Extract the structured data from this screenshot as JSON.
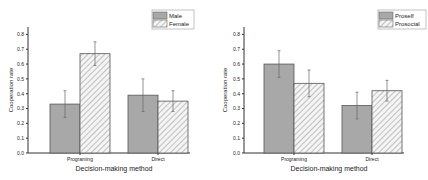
{
  "chart_data": [
    {
      "type": "bar",
      "title": "",
      "xlabel": "Decision-making method",
      "ylabel": "Cooperation rate",
      "ylim": [
        0,
        0.85
      ],
      "yticks": [
        "0.0",
        "0.1",
        "0.2",
        "0.3",
        "0.4",
        "0.5",
        "0.6",
        "0.7",
        "0.8"
      ],
      "categories": [
        "Programing",
        "Direct"
      ],
      "series": [
        {
          "name": "Male",
          "values": [
            0.33,
            0.39
          ],
          "errors": [
            0.09,
            0.11
          ],
          "pattern": "solid-gray"
        },
        {
          "name": "Female",
          "values": [
            0.67,
            0.35
          ],
          "errors": [
            0.08,
            0.07
          ],
          "pattern": "hatched"
        }
      ],
      "legend_position": "top-right",
      "grid": false
    },
    {
      "type": "bar",
      "title": "",
      "xlabel": "Decision-making method",
      "ylabel": "Cooperation rate",
      "ylim": [
        0,
        0.85
      ],
      "yticks": [
        "0.0",
        "0.1",
        "0.2",
        "0.3",
        "0.4",
        "0.5",
        "0.6",
        "0.7",
        "0.8"
      ],
      "categories": [
        "Programing",
        "Direct"
      ],
      "series": [
        {
          "name": "Proself",
          "values": [
            0.6,
            0.32
          ],
          "errors": [
            0.09,
            0.09
          ],
          "pattern": "solid-gray"
        },
        {
          "name": "Prosocial",
          "values": [
            0.47,
            0.42
          ],
          "errors": [
            0.09,
            0.07
          ],
          "pattern": "hatched"
        }
      ],
      "legend_position": "top-right",
      "grid": false
    }
  ],
  "colors": {
    "solid_bar": "#a8a8a8",
    "hatch_line": "#8c8c8c",
    "axis": "#333333"
  }
}
